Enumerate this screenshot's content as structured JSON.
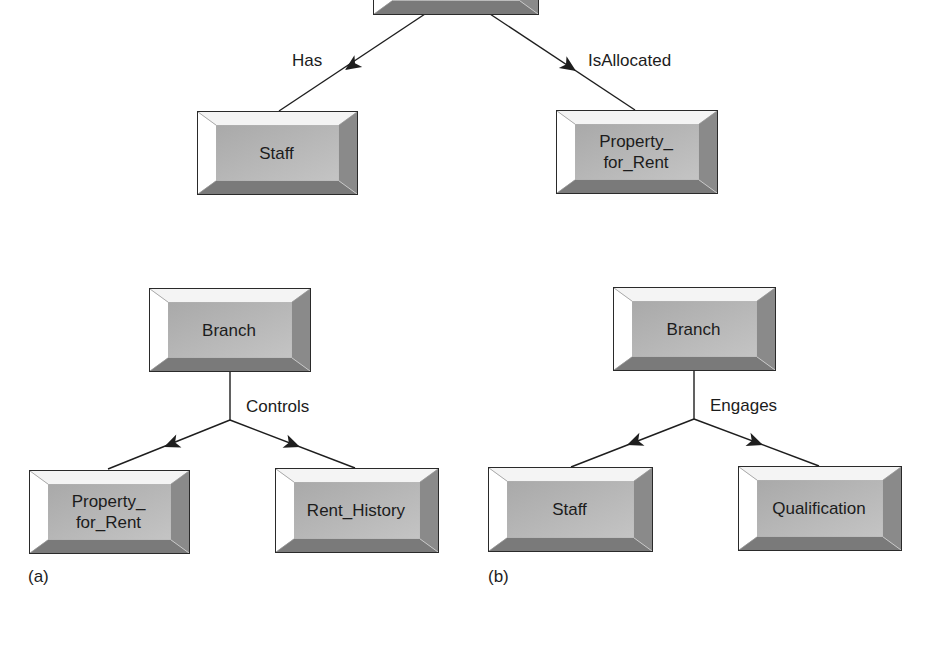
{
  "diagram": {
    "top": {
      "entities": [
        {
          "id": "top-parent",
          "label": "",
          "x": 373,
          "y": -70,
          "w": 166,
          "h": 85
        },
        {
          "id": "staff",
          "label": "Staff",
          "x": 197,
          "y": 111,
          "w": 161,
          "h": 84
        },
        {
          "id": "property-for-rent",
          "label": "Property_\nfor_Rent",
          "x": 556,
          "y": 110,
          "w": 162,
          "h": 84
        }
      ],
      "relationships": [
        {
          "label": "Has",
          "x": 292,
          "y": 51
        },
        {
          "label": "IsAllocated",
          "x": 588,
          "y": 51
        }
      ]
    },
    "a": {
      "caption": "(a)",
      "parent": {
        "label": "Branch",
        "x": 149,
        "y": 288,
        "w": 162,
        "h": 84
      },
      "relationship": {
        "label": "Controls",
        "x": 246,
        "y": 397
      },
      "children": [
        {
          "label": "Property_\nfor_Rent",
          "x": 29,
          "y": 470,
          "w": 161,
          "h": 84
        },
        {
          "label": "Rent_History",
          "x": 275,
          "y": 468,
          "w": 164,
          "h": 85
        }
      ]
    },
    "b": {
      "caption": "(b)",
      "parent": {
        "label": "Branch",
        "x": 613,
        "y": 287,
        "w": 163,
        "h": 84
      },
      "relationship": {
        "label": "Engages",
        "x": 710,
        "y": 396
      },
      "children": [
        {
          "label": "Staff",
          "x": 488,
          "y": 467,
          "w": 165,
          "h": 85
        },
        {
          "label": "Qualification",
          "x": 738,
          "y": 466,
          "w": 164,
          "h": 85
        }
      ]
    }
  },
  "colors": {
    "line": "#1e1e1e",
    "face": "#b4b4b4",
    "bevel_top": "#f4f4f4",
    "bevel_left": "#ffffff",
    "bevel_right": "#8a8a8a",
    "bevel_bottom": "#7a7a7a"
  }
}
